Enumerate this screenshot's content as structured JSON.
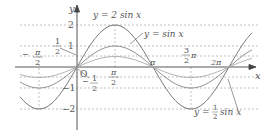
{
  "chart_data": {
    "type": "line",
    "title": "",
    "xlabel": "x",
    "ylabel": "y",
    "origin_label": "O",
    "x_ticks": [
      "-π/2",
      "π/2",
      "π",
      "3/2 π",
      "2π"
    ],
    "y_ticks": [
      "2",
      "1",
      "1/2",
      "-1/2",
      "-1",
      "-2"
    ],
    "series": [
      {
        "name": "y=2sin x",
        "amplitude": 2
      },
      {
        "name": "y=sin x",
        "amplitude": 1
      },
      {
        "name": "y=1/2 sin x",
        "amplitude": 0.5
      }
    ],
    "xlim": [
      "-π/2",
      "2π+"
    ],
    "ylim": [
      -2,
      2
    ],
    "grid": "dashed guides at tick values"
  },
  "labels": {
    "y_axis": "y",
    "x_axis": "x",
    "origin": "O",
    "y2": "2",
    "y1": "1",
    "yhalf_num": "1",
    "yhalf_den": "2",
    "yneg1": "−1",
    "yneg2": "−2",
    "yneghalf_sign": "−",
    "yneghalf_num": "1",
    "yneghalf_den": "2",
    "xnegpi2_sign": "−",
    "xnegpi2_num": "π",
    "xnegpi2_den": "2",
    "xpi2_num": "π",
    "xpi2_den": "2",
    "xpi": "π",
    "x3pi2_num": "3",
    "x3pi2_den": "2",
    "x3pi2_pi": "π",
    "x2pi": "2π",
    "curve_2sin": "y = 2 sin x",
    "curve_sin": "y = sin x",
    "curve_half_prefix": "y =",
    "curve_half_num": "1",
    "curve_half_den": "2",
    "curve_half_suffix": "sin x"
  }
}
